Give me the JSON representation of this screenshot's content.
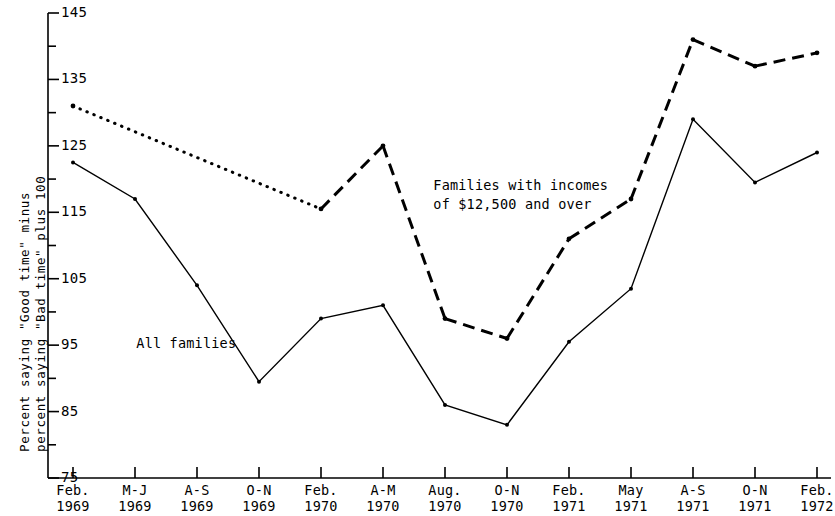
{
  "axis": {
    "y_title_line1": "Percent saying \"Good time\" minus",
    "y_title_line2": "percent saying \"Bad time\" plus 100",
    "y_tick_labels": [
      "145",
      "135",
      "125",
      "115",
      "105",
      "95",
      "85",
      "75"
    ],
    "y_min": 75,
    "y_max": 145,
    "y_major_step": 10,
    "y_minor_step": 5,
    "x_tick_labels": [
      {
        "line1": "Feb.",
        "line2": "1969"
      },
      {
        "line1": "M-J",
        "line2": "1969"
      },
      {
        "line1": "A-S",
        "line2": "1969"
      },
      {
        "line1": "O-N",
        "line2": "1969"
      },
      {
        "line1": "Feb.",
        "line2": "1970"
      },
      {
        "line1": "A-M",
        "line2": "1970"
      },
      {
        "line1": "Aug.",
        "line2": "1970"
      },
      {
        "line1": "O-N",
        "line2": "1970"
      },
      {
        "line1": "Feb.",
        "line2": "1971"
      },
      {
        "line1": "May",
        "line2": "1971"
      },
      {
        "line1": "A-S",
        "line2": "1971"
      },
      {
        "line1": "O-N",
        "line2": "1971"
      },
      {
        "line1": "Feb.",
        "line2": "1972"
      }
    ]
  },
  "annotations": {
    "high_income_line1": "Families with incomes",
    "high_income_line2": "of $12,500 and over",
    "all_families": "All families"
  },
  "colors": {
    "ink": "#000000",
    "background": "#ffffff"
  },
  "chart_data": {
    "type": "line",
    "title": "",
    "xlabel": "",
    "ylabel": "Percent saying \"Good time\" minus percent saying \"Bad time\" plus 100",
    "ylim": [
      75,
      145
    ],
    "grid": false,
    "legend": "annotated-inline",
    "categories": [
      "Feb. 1969",
      "M-J 1969",
      "A-S 1969",
      "O-N 1969",
      "Feb. 1970",
      "A-M 1970",
      "Aug. 1970",
      "O-N 1970",
      "Feb. 1971",
      "May 1971",
      "A-S 1971",
      "O-N 1971",
      "Feb. 1972"
    ],
    "series": [
      {
        "name": "All families",
        "style": "solid",
        "marker": "dot",
        "values": [
          122.5,
          117,
          104,
          89.5,
          99,
          101,
          86,
          83,
          95.5,
          103.5,
          129,
          119.5,
          124
        ]
      },
      {
        "name": "Families with incomes of $12,500 and over",
        "style": "dotted-then-dashed",
        "marker": "dot",
        "note": "dotted from Feb. 1969 to Feb. 1970; dashed thereafter",
        "values": [
          131,
          null,
          null,
          null,
          115.5,
          125,
          99,
          96,
          111,
          117,
          141,
          137,
          139
        ]
      }
    ]
  }
}
